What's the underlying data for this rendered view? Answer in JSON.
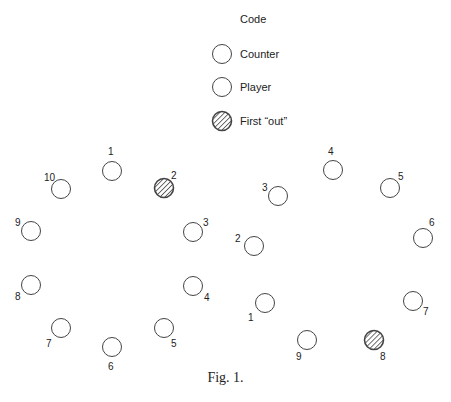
{
  "legend": {
    "title": "Code",
    "items": [
      {
        "label": "Counter",
        "style": "plain",
        "cx": 222,
        "cy": 54
      },
      {
        "label": "Player",
        "style": "plain",
        "cx": 222,
        "cy": 87
      },
      {
        "label": "First “out”",
        "style": "hatched",
        "cx": 222,
        "cy": 121
      }
    ]
  },
  "left_circle": {
    "players": [
      {
        "n": "1",
        "cx": 112,
        "cy": 171,
        "lx": 108,
        "ly": 147,
        "style": "plain"
      },
      {
        "n": "2",
        "cx": 164,
        "cy": 188,
        "lx": 171,
        "ly": 171,
        "style": "hatched"
      },
      {
        "n": "3",
        "cx": 193,
        "cy": 232,
        "lx": 203,
        "ly": 218,
        "style": "plain"
      },
      {
        "n": "4",
        "cx": 193,
        "cy": 286,
        "lx": 204,
        "ly": 293,
        "style": "plain"
      },
      {
        "n": "5",
        "cx": 164,
        "cy": 328,
        "lx": 171,
        "ly": 339,
        "style": "plain"
      },
      {
        "n": "6",
        "cx": 112,
        "cy": 347,
        "lx": 108,
        "ly": 362,
        "style": "plain"
      },
      {
        "n": "7",
        "cx": 61,
        "cy": 328,
        "lx": 46,
        "ly": 339,
        "style": "plain"
      },
      {
        "n": "8",
        "cx": 31,
        "cy": 285,
        "lx": 15,
        "ly": 292,
        "style": "plain"
      },
      {
        "n": "9",
        "cx": 31,
        "cy": 231,
        "lx": 15,
        "ly": 218,
        "style": "plain"
      },
      {
        "n": "10",
        "cx": 61,
        "cy": 189,
        "lx": 44,
        "ly": 173,
        "style": "plain"
      }
    ]
  },
  "right_circle": {
    "players": [
      {
        "n": "1",
        "cx": 265,
        "cy": 303,
        "lx": 248,
        "ly": 313,
        "style": "plain"
      },
      {
        "n": "2",
        "cx": 254,
        "cy": 246,
        "lx": 235,
        "ly": 234,
        "style": "plain"
      },
      {
        "n": "3",
        "cx": 278,
        "cy": 196,
        "lx": 262,
        "ly": 183,
        "style": "plain"
      },
      {
        "n": "4",
        "cx": 333,
        "cy": 170,
        "lx": 328,
        "ly": 147,
        "style": "plain"
      },
      {
        "n": "5",
        "cx": 390,
        "cy": 188,
        "lx": 398,
        "ly": 172,
        "style": "plain"
      },
      {
        "n": "6",
        "cx": 423,
        "cy": 238,
        "lx": 429,
        "ly": 218,
        "style": "plain"
      },
      {
        "n": "7",
        "cx": 413,
        "cy": 301,
        "lx": 423,
        "ly": 307,
        "style": "plain"
      },
      {
        "n": "8",
        "cx": 374,
        "cy": 340,
        "lx": 380,
        "ly": 352,
        "style": "hatched"
      },
      {
        "n": "9",
        "cx": 307,
        "cy": 340,
        "lx": 296,
        "ly": 352,
        "style": "plain"
      }
    ]
  },
  "caption": "Fig. 1.",
  "colors": {
    "stroke": "#444444",
    "text": "#222222",
    "background": "#ffffff"
  }
}
